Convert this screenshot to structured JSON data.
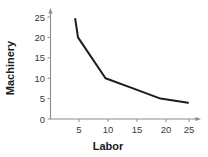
{
  "chart_data": {
    "type": "line",
    "title": "",
    "xlabel": "Labor",
    "ylabel": "Machinery",
    "x": [
      4.5,
      5,
      10,
      15,
      20,
      25
    ],
    "values": [
      24.5,
      20,
      10,
      7.5,
      5,
      4
    ],
    "series": [
      {
        "name": "Machinery vs Labor",
        "x": [
          4.5,
          5,
          10,
          15,
          20,
          25
        ],
        "values": [
          24.5,
          20,
          10,
          7.5,
          5,
          4
        ]
      }
    ],
    "xlim": [
      0,
      27
    ],
    "ylim": [
      0,
      26
    ],
    "xticks": [
      5,
      10,
      15,
      20,
      25
    ],
    "yticks": [
      0,
      5,
      10,
      15,
      20,
      25
    ],
    "xtick_labels": [
      "5",
      "10",
      "15",
      "20",
      "25"
    ],
    "ytick_labels": [
      "0",
      "5",
      "10",
      "15",
      "20",
      "25"
    ],
    "grid": false,
    "legend": false,
    "legend_position": "none",
    "line_color": "#1c1c1c",
    "axis_color": "#8c8c8c",
    "background_color": "#ffffff"
  },
  "labels": {
    "x_axis_title": "Labor",
    "y_axis_title": "Machinery",
    "y_tick_0": "0",
    "y_tick_5": "5",
    "y_tick_10": "10",
    "y_tick_15": "15",
    "y_tick_20": "20",
    "y_tick_25": "25",
    "x_tick_5": "5",
    "x_tick_10": "10",
    "x_tick_15": "15",
    "x_tick_20": "20",
    "x_tick_25": "25"
  }
}
